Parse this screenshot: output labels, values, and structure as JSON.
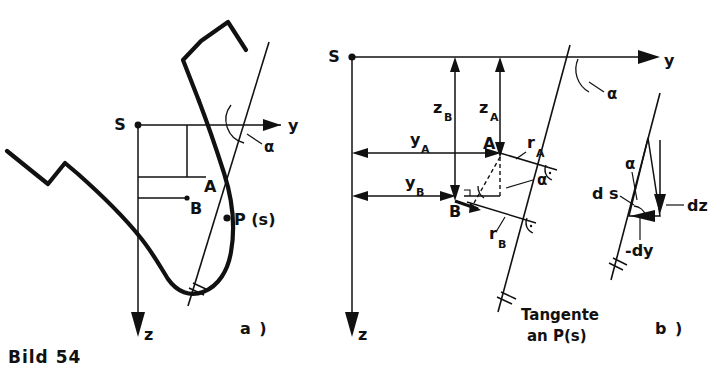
{
  "figure": {
    "caption": "Bild 54",
    "panels": [
      {
        "id": "a",
        "label": "a )"
      },
      {
        "id": "b",
        "label": "b )"
      }
    ]
  },
  "panel_a": {
    "origin_label": "S",
    "axis_y_label": "y",
    "axis_z_label": "z",
    "angle_label": "α",
    "point_a_label": "A",
    "point_b_label": "B",
    "point_p_label": "P (s)",
    "tangent_break_icon": "break-hatch-icon",
    "curve_break_icon": "curve-break-icon"
  },
  "panel_middle": {
    "origin_label": "S",
    "axis_y_label": "y",
    "axis_z_label": "z",
    "angle_label_top": "α",
    "angle_label_inner": "α",
    "point_a_label": "A",
    "point_b_label": "B",
    "dim_z_a": {
      "base": "z",
      "sub": "A"
    },
    "dim_z_b": {
      "base": "z",
      "sub": "B"
    },
    "dim_y_a": {
      "base": "y",
      "sub": "A"
    },
    "dim_y_b": {
      "base": "y",
      "sub": "B"
    },
    "radius_a": {
      "base": "r",
      "sub": "A"
    },
    "radius_b": {
      "base": "r",
      "sub": "B"
    },
    "tangent_caption_line1": "Tangente",
    "tangent_caption_line2": "an P(s)",
    "right_angle_icon": "right-angle-mark-icon",
    "break_icon": "break-hatch-icon"
  },
  "panel_b": {
    "angle_label": "α",
    "ds_label": "d s",
    "dz_label": "dz",
    "dy_label": "-dy",
    "break_icon": "break-hatch-icon"
  },
  "colors": {
    "ink": "#111111",
    "paper": "#ffffff"
  }
}
